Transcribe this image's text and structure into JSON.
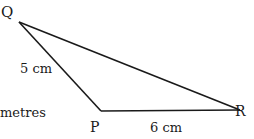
{
  "diagram": {
    "type": "triangle",
    "vertices": [
      {
        "name": "Q",
        "x": 19,
        "y": 22
      },
      {
        "name": "P",
        "x": 101,
        "y": 111
      },
      {
        "name": "R",
        "x": 240,
        "y": 110
      }
    ],
    "edges": [
      {
        "from": "Q",
        "to": "P",
        "label": "5 cm"
      },
      {
        "from": "P",
        "to": "R",
        "label": "6 cm"
      },
      {
        "from": "Q",
        "to": "R",
        "label": ""
      }
    ],
    "stroke_color": "#1a1a1a"
  },
  "labels": {
    "q": "Q",
    "p": "P",
    "r": "R",
    "qp_length": "5 cm",
    "pr_length": "6 cm",
    "partial_text": "metres"
  }
}
